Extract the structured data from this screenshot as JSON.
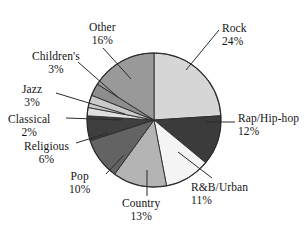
{
  "chart_data": {
    "type": "pie",
    "title": "",
    "subtitle": "",
    "legend_position": "none",
    "grid": false,
    "units": "percent",
    "start_angle_deg": 0,
    "direction": "clockwise",
    "categories": [
      "Rock",
      "Rap/Hip-hop",
      "R&B/Urban",
      "Country",
      "Pop",
      "Religious",
      "Classical",
      "Jazz",
      "Children's",
      "Other"
    ],
    "values": [
      24,
      12,
      11,
      13,
      10,
      6,
      2,
      3,
      3,
      16
    ],
    "slices": [
      {
        "label": "Rock",
        "value": 24,
        "percent_text": "24%",
        "color": "#d6d6d6"
      },
      {
        "label": "Rap/Hip-hop",
        "value": 12,
        "percent_text": "12%",
        "color": "#3b3b3b"
      },
      {
        "label": "R&B/Urban",
        "value": 11,
        "percent_text": "11%",
        "color": "#f4f4f4"
      },
      {
        "label": "Country",
        "value": 13,
        "percent_text": "13%",
        "color": "#b4b4b4"
      },
      {
        "label": "Pop",
        "value": 10,
        "percent_text": "10%",
        "color": "#636363"
      },
      {
        "label": "Religious",
        "value": 6,
        "percent_text": "6%",
        "color": "#3f3f3f"
      },
      {
        "label": "Classical",
        "value": 2,
        "percent_text": "2%",
        "color": "#e0e0e0"
      },
      {
        "label": "Jazz",
        "value": 3,
        "percent_text": "3%",
        "color": "#c9c9c9"
      },
      {
        "label": "Children's",
        "value": 3,
        "percent_text": "3%",
        "color": "#8d8d8d"
      },
      {
        "label": "Other",
        "value": 16,
        "percent_text": "16%",
        "color": "#999999"
      }
    ],
    "xlabel": "",
    "ylabel": ""
  },
  "labels": {
    "rock": {
      "name": "Rock",
      "percent": "24%"
    },
    "rap": {
      "name": "Rap/Hip-hop",
      "percent": "12%"
    },
    "rnb": {
      "name": "R&B/Urban",
      "percent": "11%"
    },
    "country": {
      "name": "Country",
      "percent": "13%"
    },
    "pop": {
      "name": "Pop",
      "percent": "10%"
    },
    "religious": {
      "name": "Religious",
      "percent": "6%"
    },
    "classical": {
      "name": "Classical",
      "percent": "2%"
    },
    "jazz": {
      "name": "Jazz",
      "percent": "3%"
    },
    "children": {
      "name": "Children's",
      "percent": "3%"
    },
    "other": {
      "name": "Other",
      "percent": "16%"
    }
  },
  "style": {
    "background": "#ffffff",
    "outline": "#2b2b2b",
    "leader_line": "#2b2b2b",
    "text": "#141414"
  }
}
